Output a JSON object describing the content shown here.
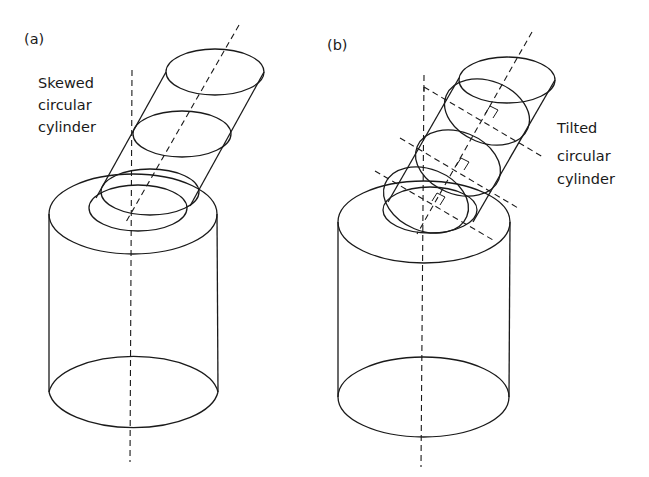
{
  "figure": {
    "panels": [
      {
        "id": "a",
        "label": "(a)",
        "caption_lines": [
          "Skewed",
          "circular",
          "cylinder"
        ]
      },
      {
        "id": "b",
        "label": "(b)",
        "caption_lines": [
          "Tilted",
          "circular",
          "cylinder"
        ]
      }
    ]
  },
  "colors": {
    "stroke": "#1a1a1a",
    "background": "#ffffff"
  }
}
